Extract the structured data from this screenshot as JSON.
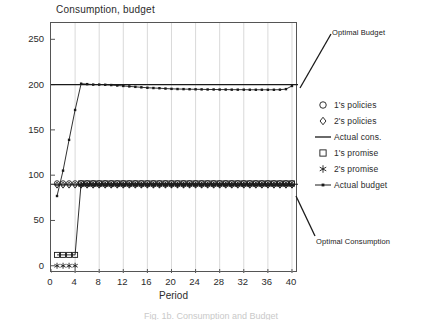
{
  "chart_data": {
    "type": "line",
    "title": "Consumption, budget",
    "xlabel": "Period",
    "ylabel": "",
    "xlim": [
      0,
      41
    ],
    "ylim": [
      -8,
      268
    ],
    "xticks": [
      "0",
      "4",
      "8",
      "12",
      "16",
      "20",
      "24",
      "28",
      "32",
      "36",
      "40"
    ],
    "xtick_values": [
      0,
      4,
      8,
      12,
      16,
      20,
      24,
      28,
      32,
      36,
      40
    ],
    "yticks": [
      "0",
      "50",
      "100",
      "150",
      "200",
      "250"
    ],
    "ytick_values": [
      0,
      50,
      100,
      150,
      200,
      250
    ],
    "grid": "vertical",
    "legend_position": "right",
    "x": [
      1,
      2,
      3,
      4,
      5,
      6,
      7,
      8,
      9,
      10,
      11,
      12,
      13,
      14,
      15,
      16,
      17,
      18,
      19,
      20,
      21,
      22,
      23,
      24,
      25,
      26,
      27,
      28,
      29,
      30,
      31,
      32,
      33,
      34,
      35,
      36,
      37,
      38,
      39,
      40
    ],
    "series": [
      {
        "name": "1's policies",
        "marker": "circle",
        "values": [
          91,
          91,
          91,
          91,
          91,
          91,
          91,
          91,
          91,
          91,
          91,
          91,
          91,
          91,
          91,
          91,
          91,
          91,
          91,
          91,
          91,
          91,
          91,
          91,
          91,
          91,
          91,
          91,
          91,
          91,
          91,
          91,
          91,
          91,
          91,
          91,
          91,
          91,
          91,
          91
        ]
      },
      {
        "name": "2's policies",
        "marker": "diamond",
        "values": [
          89,
          89,
          89,
          89,
          89,
          89,
          89,
          89,
          89,
          89,
          89,
          89,
          89,
          89,
          89,
          89,
          89,
          89,
          89,
          89,
          89,
          89,
          89,
          89,
          89,
          89,
          89,
          89,
          89,
          89,
          89,
          89,
          89,
          89,
          89,
          89,
          89,
          89,
          89,
          89
        ]
      },
      {
        "name": "Actual cons.",
        "marker": "line",
        "values": [
          90,
          90,
          90,
          90,
          90,
          90,
          90,
          90,
          90,
          90,
          90,
          90,
          90,
          90,
          90,
          90,
          90,
          90,
          90,
          90,
          90,
          90,
          90,
          90,
          90,
          90,
          90,
          90,
          90,
          90,
          90,
          90,
          90,
          90,
          90,
          90,
          90,
          90,
          90,
          90
        ]
      },
      {
        "name": "1's promise",
        "marker": "square",
        "values": [
          12,
          12,
          12,
          12,
          91,
          91,
          91,
          91,
          91,
          91,
          91,
          91,
          91,
          91,
          91,
          91,
          91,
          91,
          91,
          91,
          91,
          91,
          91,
          91,
          91,
          91,
          91,
          91,
          91,
          91,
          91,
          91,
          91,
          91,
          91,
          91,
          91,
          91,
          91,
          91
        ]
      },
      {
        "name": "2's promise",
        "marker": "asterisk",
        "values": [
          0,
          0,
          0,
          0,
          89,
          89,
          89,
          89,
          89,
          89,
          89,
          89,
          89,
          89,
          89,
          89,
          89,
          89,
          89,
          89,
          89,
          89,
          89,
          89,
          89,
          89,
          89,
          89,
          89,
          89,
          89,
          89,
          89,
          89,
          89,
          89,
          89,
          89,
          89,
          89
        ]
      },
      {
        "name": "Actual budget",
        "marker": "line-dot",
        "values": [
          77,
          105,
          139,
          172,
          201,
          200.5,
          200,
          200,
          199.8,
          199.5,
          199,
          198.5,
          198,
          197.5,
          197,
          196.5,
          196.2,
          196,
          195.6,
          195.3,
          195.1,
          195,
          194.9,
          194.8,
          194.7,
          194.6,
          194.6,
          194.5,
          194.5,
          194.4,
          194.4,
          194.4,
          194.3,
          194.3,
          194.3,
          194.3,
          194.3,
          194.4,
          195,
          198.5
        ]
      }
    ],
    "reference_lines": [
      {
        "name": "Optimal Budget",
        "value": 200
      },
      {
        "name": "Optimal Consumption",
        "value": 90
      }
    ],
    "annotations": [
      {
        "text": "Optimal Budget",
        "points_to_value": 200,
        "points_to_x": 40
      },
      {
        "text": "Optimal Consumption",
        "points_to_value": 90,
        "points_to_x": 40
      }
    ]
  },
  "legend": {
    "items": [
      {
        "label": "1's policies",
        "marker": "circle-icon"
      },
      {
        "label": "2's policies",
        "marker": "diamond-icon"
      },
      {
        "label": "Actual cons.",
        "marker": "line-icon"
      },
      {
        "label": "1's promise",
        "marker": "square-icon"
      },
      {
        "label": "2's promise",
        "marker": "asterisk-icon"
      },
      {
        "label": "Actual budget",
        "marker": "line-dot-icon"
      }
    ]
  },
  "caption": {
    "text": "Fig. 1b. Consumption and Budget"
  },
  "colors": {
    "ink": "#1a1a1a",
    "axis": "#555555",
    "grid": "#cfcfcf",
    "background": "#ffffff"
  }
}
